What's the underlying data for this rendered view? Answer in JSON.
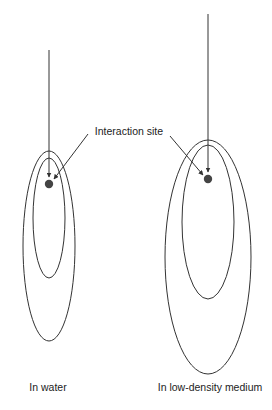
{
  "diagram": {
    "annotation_label": "Interaction site",
    "panels": [
      {
        "label": "In water"
      },
      {
        "label": "In low-density medium"
      }
    ],
    "colors": {
      "stroke": "#333333",
      "dot": "#444444",
      "text": "#222222"
    }
  }
}
